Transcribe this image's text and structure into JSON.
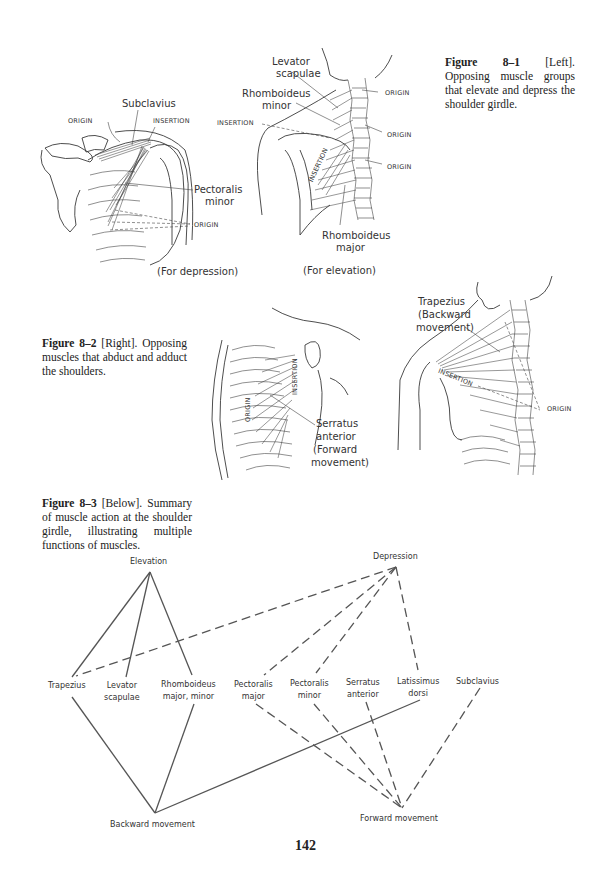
{
  "page": {
    "number": "142",
    "background": "#ffffff"
  },
  "figure_8_1": {
    "caption_label": "Figure 8–1",
    "caption_text": " [Left]. Opposing muscle groups that elevate and depress the shoulder girdle.",
    "left_panel": {
      "labels": {
        "subclavius": "Subclavius",
        "origin_top": "ORIGIN",
        "insertion": "INSERTION",
        "pectoralis_minor_1": "Pectoralis",
        "pectoralis_minor_2": "minor",
        "origin_bottom": "ORIGIN"
      },
      "subtitle": "(For depression)"
    },
    "right_panel": {
      "labels": {
        "levator_1": "Levator",
        "levator_2": "scapulae",
        "rhomb_minor_1": "Rhomboideus",
        "rhomb_minor_2": "minor",
        "insertion_left": "INSERTION",
        "insertion_vertical": "INSERTION",
        "origin_1": "ORIGIN",
        "origin_2": "ORIGIN",
        "origin_3": "ORIGIN",
        "rhomb_major_1": "Rhomboideus",
        "rhomb_major_2": "major"
      },
      "subtitle": "(For elevation)"
    }
  },
  "figure_8_2": {
    "caption_label": "Figure 8–2",
    "caption_text": " [Right]. Opposing muscles that abduct and adduct the shoulders.",
    "front_panel": {
      "labels": {
        "origin": "ORIGIN",
        "insertion": "INSERTION",
        "serratus_1": "Serratus",
        "serratus_2": "anterior",
        "serratus_3": "(Forward",
        "serratus_4": "movement)"
      }
    },
    "back_panel": {
      "labels": {
        "trapezius_1": "Trapezius",
        "trapezius_2": "(Backward",
        "trapezius_3": "movement)",
        "insertion": "INSERTION",
        "origin": "ORIGIN"
      }
    }
  },
  "figure_8_3": {
    "caption_label": "Figure 8–3",
    "caption_text": " [Below]. Summary of muscle action at the shoulder girdle, illustrating multiple functions of muscles.",
    "actions": {
      "elevation": "Elevation",
      "depression": "Depression",
      "backward": "Backward movement",
      "forward": "Forward movement"
    },
    "muscles": [
      {
        "line1": "Trapezius",
        "line2": ""
      },
      {
        "line1": "Levator",
        "line2": "scapulae"
      },
      {
        "line1": "Rhomboideus",
        "line2": "major, minor"
      },
      {
        "line1": "Pectoralis",
        "line2": "major"
      },
      {
        "line1": "Pectoralis",
        "line2": "minor"
      },
      {
        "line1": "Serratus",
        "line2": "anterior"
      },
      {
        "line1": "Latissimus",
        "line2": "dorsi"
      },
      {
        "line1": "Subclavius",
        "line2": ""
      }
    ],
    "connections": {
      "elevation": [
        "Trapezius",
        "Levator scapulae",
        "Rhomboideus major, minor"
      ],
      "depression": [
        "Trapezius",
        "Pectoralis major",
        "Pectoralis minor",
        "Latissimus dorsi"
      ],
      "backward_movement": [
        "Trapezius",
        "Rhomboideus major, minor",
        "Latissimus dorsi"
      ],
      "forward_movement": [
        "Pectoralis major",
        "Pectoralis minor",
        "Serratus anterior",
        "Subclavius"
      ]
    }
  }
}
